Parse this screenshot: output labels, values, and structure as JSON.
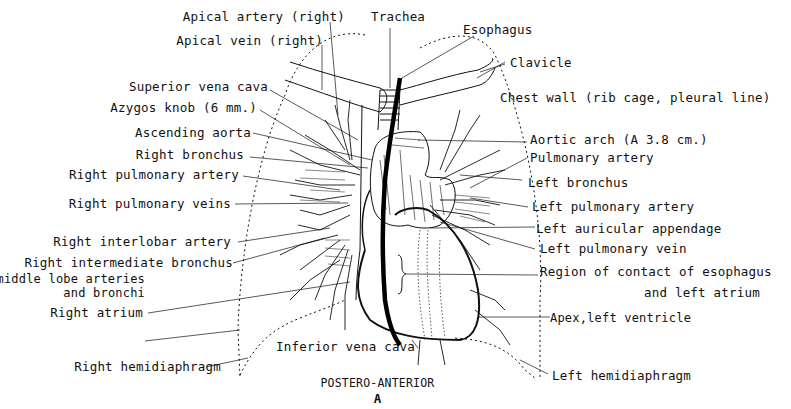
{
  "diagram": {
    "view_title": "POSTERO-ANTERIOR",
    "panel_letter": "A",
    "labels_left": [
      {
        "id": "apical-artery-right",
        "text": "Apical artery (right)"
      },
      {
        "id": "apical-vein-right",
        "text": "Apical vein (right)"
      },
      {
        "id": "superior-vena-cava",
        "text": "Superior vena cava"
      },
      {
        "id": "azygos-knob",
        "text": "Azygos knob (6 mm.)"
      },
      {
        "id": "ascending-aorta",
        "text": "Ascending aorta"
      },
      {
        "id": "right-bronchus",
        "text": "Right bronchus"
      },
      {
        "id": "right-pulmonary-artery",
        "text": "Right pulmonary artery"
      },
      {
        "id": "right-pulmonary-veins",
        "text": "Right pulmonary veins"
      },
      {
        "id": "right-interlobar-artery",
        "text": "Right interlobar artery"
      },
      {
        "id": "right-intermediate-bronchus",
        "text": "Right intermediate bronchus"
      },
      {
        "id": "right-middle-lobe-1",
        "text": "Right middle lobe arteries"
      },
      {
        "id": "right-middle-lobe-2",
        "text": "and bronchi"
      },
      {
        "id": "right-atrium",
        "text": "Right atrium"
      },
      {
        "id": "right-hemidiaphragm",
        "text": "Right hemidiaphragm"
      }
    ],
    "labels_top": [
      {
        "id": "trachea",
        "text": "Trachea"
      },
      {
        "id": "esophagus",
        "text": "Esophagus"
      }
    ],
    "labels_right": [
      {
        "id": "clavicle",
        "text": "Clavicle"
      },
      {
        "id": "chest-wall",
        "text": "Chest wall (rib cage, pleural line)"
      },
      {
        "id": "aortic-arch",
        "text": "Aortic arch (A 3.8 cm.)"
      },
      {
        "id": "pulmonary-artery",
        "text": "Pulmonary artery"
      },
      {
        "id": "left-bronchus",
        "text": "Left bronchus"
      },
      {
        "id": "left-pulmonary-artery",
        "text": "Left pulmonary artery"
      },
      {
        "id": "left-auricular-appendage",
        "text": "Left auricular appendage"
      },
      {
        "id": "left-pulmonary-vein",
        "text": "Left pulmonary vein"
      },
      {
        "id": "region-contact-1",
        "text": "Region of contact of esophagus"
      },
      {
        "id": "region-contact-2",
        "text": "and left atrium"
      },
      {
        "id": "apex-left-ventricle",
        "text": "Apex,left ventricle"
      },
      {
        "id": "left-hemidiaphragm",
        "text": "Left hemidiaphragm"
      }
    ],
    "labels_bottom": [
      {
        "id": "inferior-vena-cava",
        "text": "Inferior vena cava"
      }
    ],
    "colors": {
      "ink": "#111111",
      "background": "#ffffff"
    }
  }
}
